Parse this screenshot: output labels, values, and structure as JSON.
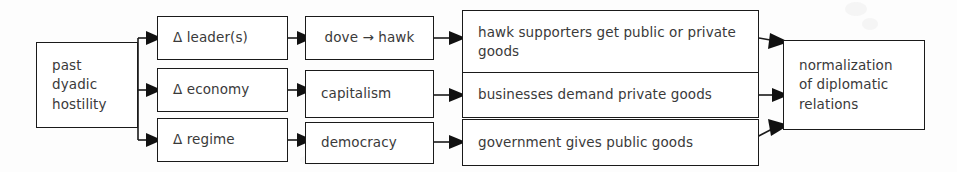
{
  "diagram": {
    "ink_color": "#1a1a1a",
    "text_color": "#3a3a3a",
    "background_color": "#fdfdfd",
    "nodes": {
      "source": {
        "text": "past\ndyadic\nhostility"
      },
      "change_leaders": {
        "text": "Δ leader(s)"
      },
      "change_economy": {
        "text": "Δ economy"
      },
      "change_regime": {
        "text": "Δ regime"
      },
      "dove_to_hawk": {
        "text": "dove → hawk"
      },
      "capitalism": {
        "text": "capitalism"
      },
      "democracy": {
        "text": "democracy"
      },
      "hawk_supporters": {
        "text": "hawk supporters get public or private goods"
      },
      "businesses": {
        "text": "businesses demand private goods"
      },
      "government": {
        "text": "government gives public goods"
      },
      "outcome": {
        "text": "normalization\nof diplomatic\nrelations"
      }
    }
  }
}
